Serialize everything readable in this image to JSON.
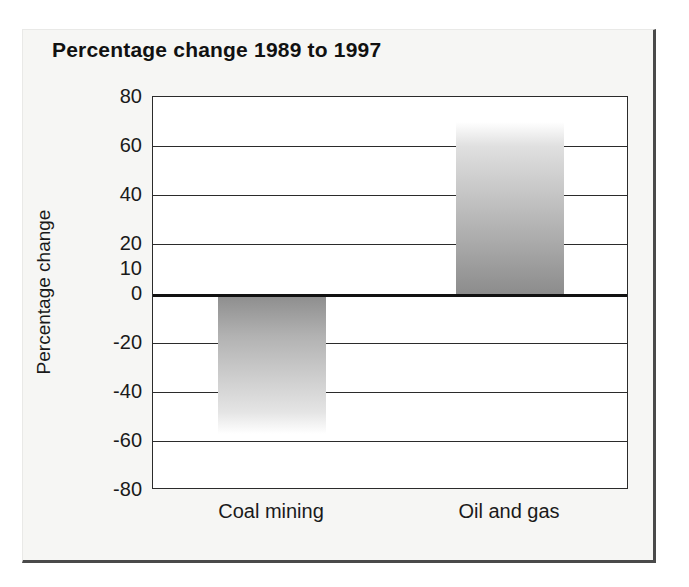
{
  "figure": {
    "title": "Percentage change 1989 to 1997"
  },
  "chart_data": {
    "type": "bar",
    "title": "Percentage change 1989 to 1997",
    "xlabel": "",
    "ylabel": "Percentage change",
    "categories": [
      "Coal mining",
      "Oil and gas"
    ],
    "values": [
      -57,
      70
    ],
    "series": [
      {
        "name": "Percentage change 1989 to 1997",
        "values": [
          -57,
          70
        ]
      }
    ],
    "ylim": [
      -80,
      80
    ],
    "yticks": [
      80,
      60,
      40,
      20,
      10,
      0,
      -20,
      -40,
      -60,
      -80
    ],
    "ytick_labels": [
      "80",
      "60",
      "40",
      "20",
      "10",
      "0",
      "-20",
      "-40",
      "-60",
      "-80"
    ],
    "gridlines": [
      80,
      60,
      40,
      20,
      0,
      -20,
      -40,
      -60,
      -80
    ],
    "grid": true,
    "legend": false,
    "zero_line": 0,
    "bar_style": "vertical-gradient-grey",
    "colors": {
      "bar_dark": "#8c8c8c",
      "bar_light": "#ffffff",
      "axis": "#2b2b2b",
      "text": "#1a1a1a",
      "page": "#f6f6f4"
    }
  }
}
